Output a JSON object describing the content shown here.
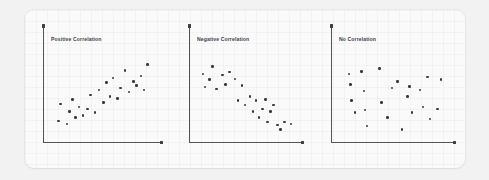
{
  "figure": {
    "background_color": "#f2f2f3",
    "card_color": "#fafafa",
    "axis_color": "#54545d",
    "dot_color": "#3a3a44",
    "title_color": "#3c3c46"
  },
  "chart_data": [
    {
      "type": "scatter",
      "title": "Positive Correlation",
      "xlabel": "",
      "ylabel": "",
      "xlim": [
        0,
        100
      ],
      "ylim": [
        0,
        100
      ],
      "grid": false,
      "legend": "none",
      "points": [
        {
          "x": 8,
          "y": 18
        },
        {
          "x": 10,
          "y": 36
        },
        {
          "x": 16,
          "y": 15
        },
        {
          "x": 18,
          "y": 28
        },
        {
          "x": 21,
          "y": 41
        },
        {
          "x": 24,
          "y": 22
        },
        {
          "x": 27,
          "y": 33
        },
        {
          "x": 31,
          "y": 24
        },
        {
          "x": 35,
          "y": 31
        },
        {
          "x": 38,
          "y": 46
        },
        {
          "x": 42,
          "y": 27
        },
        {
          "x": 46,
          "y": 51
        },
        {
          "x": 50,
          "y": 38
        },
        {
          "x": 53,
          "y": 59
        },
        {
          "x": 56,
          "y": 44
        },
        {
          "x": 59,
          "y": 64
        },
        {
          "x": 63,
          "y": 42
        },
        {
          "x": 66,
          "y": 53
        },
        {
          "x": 70,
          "y": 72
        },
        {
          "x": 74,
          "y": 49
        },
        {
          "x": 78,
          "y": 60
        },
        {
          "x": 81,
          "y": 56
        },
        {
          "x": 85,
          "y": 66
        },
        {
          "x": 88,
          "y": 51
        },
        {
          "x": 91,
          "y": 78
        }
      ]
    },
    {
      "type": "scatter",
      "title": "Negative Correlation",
      "xlabel": "",
      "ylabel": "",
      "xlim": [
        0,
        100
      ],
      "ylim": [
        0,
        100
      ],
      "grid": false,
      "legend": "none",
      "points": [
        {
          "x": 7,
          "y": 68
        },
        {
          "x": 9,
          "y": 54
        },
        {
          "x": 13,
          "y": 62
        },
        {
          "x": 16,
          "y": 76
        },
        {
          "x": 20,
          "y": 52
        },
        {
          "x": 26,
          "y": 67
        },
        {
          "x": 29,
          "y": 57
        },
        {
          "x": 33,
          "y": 70
        },
        {
          "x": 38,
          "y": 63
        },
        {
          "x": 41,
          "y": 40
        },
        {
          "x": 45,
          "y": 56
        },
        {
          "x": 48,
          "y": 35
        },
        {
          "x": 53,
          "y": 44
        },
        {
          "x": 56,
          "y": 28
        },
        {
          "x": 59,
          "y": 40
        },
        {
          "x": 62,
          "y": 22
        },
        {
          "x": 65,
          "y": 31
        },
        {
          "x": 68,
          "y": 41
        },
        {
          "x": 70,
          "y": 17
        },
        {
          "x": 73,
          "y": 28
        },
        {
          "x": 76,
          "y": 35
        },
        {
          "x": 80,
          "y": 14
        },
        {
          "x": 83,
          "y": 9
        },
        {
          "x": 87,
          "y": 17
        },
        {
          "x": 93,
          "y": 15
        }
      ]
    },
    {
      "type": "scatter",
      "title": "No Correlation",
      "xlabel": "",
      "ylabel": "",
      "xlim": [
        0,
        100
      ],
      "ylim": [
        0,
        100
      ],
      "grid": false,
      "legend": "none",
      "points": [
        {
          "x": 10,
          "y": 68
        },
        {
          "x": 11,
          "y": 57
        },
        {
          "x": 12,
          "y": 40
        },
        {
          "x": 15,
          "y": 27
        },
        {
          "x": 21,
          "y": 71
        },
        {
          "x": 23,
          "y": 50
        },
        {
          "x": 24,
          "y": 30
        },
        {
          "x": 26,
          "y": 13
        },
        {
          "x": 37,
          "y": 74
        },
        {
          "x": 39,
          "y": 38
        },
        {
          "x": 44,
          "y": 22
        },
        {
          "x": 48,
          "y": 53
        },
        {
          "x": 53,
          "y": 60
        },
        {
          "x": 57,
          "y": 9
        },
        {
          "x": 62,
          "y": 44
        },
        {
          "x": 64,
          "y": 55
        },
        {
          "x": 66,
          "y": 27
        },
        {
          "x": 73,
          "y": 51
        },
        {
          "x": 76,
          "y": 33
        },
        {
          "x": 80,
          "y": 65
        },
        {
          "x": 82,
          "y": 20
        },
        {
          "x": 89,
          "y": 31
        },
        {
          "x": 92,
          "y": 62
        }
      ]
    }
  ]
}
